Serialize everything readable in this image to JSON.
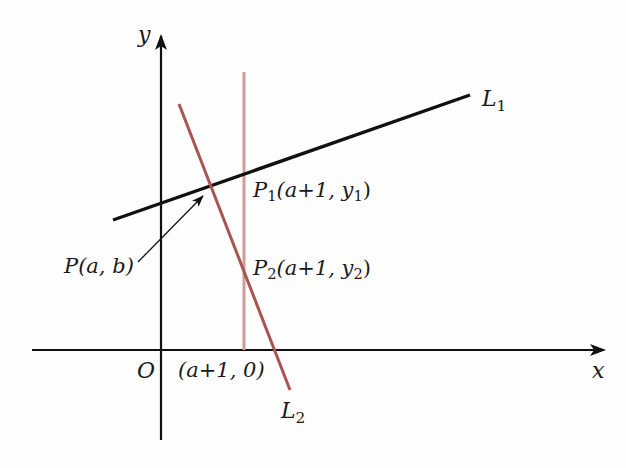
{
  "diagram": {
    "axes": {
      "x_label": "x",
      "y_label": "y",
      "origin_label": "O"
    },
    "lines": {
      "L1": {
        "label": "L",
        "subscript": "1",
        "color": "#111111"
      },
      "L2": {
        "label": "L",
        "subscript": "2",
        "color": "#a8554f"
      },
      "vertical": {
        "color": "#d49a96"
      }
    },
    "points": {
      "P": {
        "name": "P",
        "coords": "(a, b)"
      },
      "P1": {
        "name": "P",
        "subscript": "1",
        "coords_open": "(a+1, y",
        "coords_sub": "1",
        "coords_close": ")"
      },
      "P2": {
        "name": "P",
        "subscript": "2",
        "coords_open": "(a+1, y",
        "coords_sub": "2",
        "coords_close": ")"
      },
      "x_intercept": {
        "coords": "(a+1, 0)"
      }
    }
  }
}
